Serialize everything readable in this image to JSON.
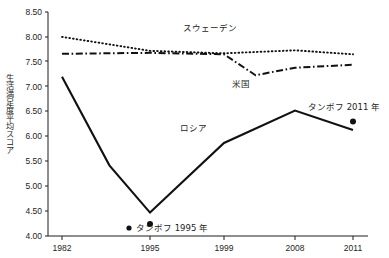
{
  "chart_data": {
    "type": "line",
    "title": "",
    "xlabel": "",
    "ylabel": "生活満足度平均スコア",
    "ylim": [
      4.0,
      8.5
    ],
    "ytick_labels": [
      "8.50",
      "8.00",
      "7.50",
      "7.00",
      "6.50",
      "6.00",
      "5.50",
      "5.00",
      "4.50",
      "4.00"
    ],
    "ytick_values": [
      8.5,
      8.0,
      7.5,
      7.0,
      6.5,
      6.0,
      5.5,
      5.0,
      4.5,
      4.0
    ],
    "xtick_labels": [
      "1982",
      "1995",
      "1999",
      "2008",
      "2011"
    ],
    "xtick_values": [
      1982,
      1995,
      1999,
      2008,
      2011
    ],
    "grid": false,
    "legend_position": "inline-annotations",
    "series": [
      {
        "name": "スウェーデン",
        "style": "dotted",
        "x": [
          1982,
          1995,
          1999,
          2008,
          2011
        ],
        "values": [
          8.0,
          7.72,
          7.67,
          7.73,
          7.65
        ]
      },
      {
        "name": "米国",
        "style": "dash-dot",
        "x": [
          1982,
          1995,
          1999,
          2003,
          2008,
          2011
        ],
        "values": [
          7.66,
          7.68,
          7.65,
          7.23,
          7.38,
          7.44
        ]
      },
      {
        "name": "ロシア",
        "style": "solid",
        "x": [
          1982,
          1989,
          1995,
          1999,
          2008,
          2011
        ],
        "values": [
          7.2,
          5.42,
          4.47,
          5.87,
          6.52,
          6.13
        ]
      }
    ],
    "annotations": [
      {
        "name": "sweden-label",
        "text": "スウェーデン",
        "x_px": 210,
        "y_px": 31
      },
      {
        "name": "us-label",
        "text": "米国",
        "x_px": 238,
        "y_px": 85
      },
      {
        "name": "russia-label",
        "text": "ロシア",
        "x_px": 190,
        "y_px": 128
      },
      {
        "name": "tambov-1995-label",
        "text": "タンボフ 1995 年",
        "x_px": 142,
        "y_px": 228
      },
      {
        "name": "tambov-2011-label",
        "text": "タンボフ 2011 年",
        "x_px": 310,
        "y_px": 108
      }
    ],
    "points": [
      {
        "name": "tambov-1995-point",
        "label": "タンボフ 1995 年",
        "year": 1995,
        "value": 4.24
      },
      {
        "name": "tambov-2011-point",
        "label": "タンボフ 2011 年",
        "year": 2011,
        "value": 6.3
      }
    ],
    "colors": {
      "line": "#111111",
      "axis": "#1d1d1d",
      "text": "#1d1d1d",
      "background": "#ffffff"
    }
  }
}
